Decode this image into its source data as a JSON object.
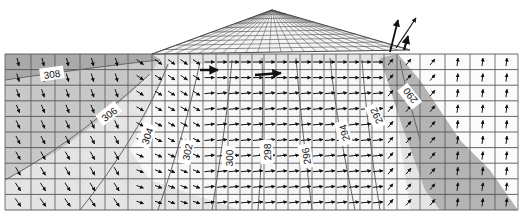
{
  "diagram": {
    "type": "flow-net",
    "colors": {
      "background": "#ffffff",
      "zone_dark": "#a9a9a9",
      "zone_mid": "#c8c8c8",
      "zone_light": "#e4e4e4",
      "zone_white": "#f7f7f7",
      "zone_right": "#b4b4b4",
      "grid_line": "#555555",
      "mesh_line": "#4a4a4a",
      "arrow": "#111111",
      "contour_line": "#666666",
      "label_bg": "#ffffff"
    },
    "contours": [
      {
        "value": "308",
        "label_x": 52,
        "label_y": 74,
        "angle": -8
      },
      {
        "value": "306",
        "label_x": 109,
        "label_y": 114,
        "angle": -38
      },
      {
        "value": "304",
        "label_x": 147,
        "label_y": 136,
        "angle": -70
      },
      {
        "value": "302",
        "label_x": 187,
        "label_y": 152,
        "angle": -78
      },
      {
        "value": "300",
        "label_x": 229,
        "label_y": 158,
        "angle": -88
      },
      {
        "value": "298",
        "label_x": 267,
        "label_y": 152,
        "angle": -92
      },
      {
        "value": "296",
        "label_x": 306,
        "label_y": 156,
        "angle": -98
      },
      {
        "value": "294",
        "label_x": 344,
        "label_y": 133,
        "angle": -105
      },
      {
        "value": "292",
        "label_x": 376,
        "label_y": 116,
        "angle": -115
      },
      {
        "value": "290",
        "label_x": 410,
        "label_y": 96,
        "angle": -128
      }
    ]
  }
}
